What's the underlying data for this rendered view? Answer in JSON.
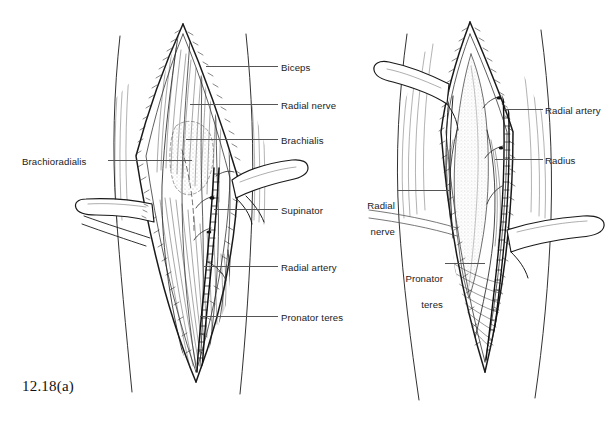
{
  "figure": {
    "background_color": "#ffffff",
    "ink_color": "#1a1a1a",
    "leader_color": "#555555"
  },
  "panel_a": {
    "caption": "12.18(a)",
    "labels": {
      "biceps": "Biceps",
      "radial_nerve": "Radial nerve",
      "brachialis": "Brachialis",
      "brachioradialis": "Brachioradialis",
      "supinator": "Supinator",
      "radial_artery": "Radial artery",
      "pronator_teres": "Pronator teres"
    }
  },
  "panel_b": {
    "caption": "12.18(b)",
    "labels": {
      "radial_artery": "Radial artery",
      "radius": "Radius",
      "radial_nerve_line1": "Radial",
      "radial_nerve_line2": "nerve",
      "pronator_teres_line1": "Pronator",
      "pronator_teres_line2": "teres"
    }
  }
}
